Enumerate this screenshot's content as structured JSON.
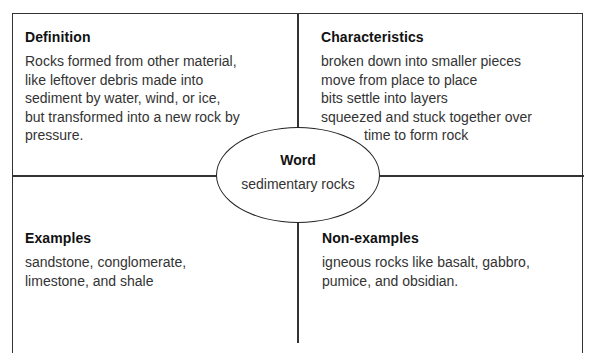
{
  "frayer_model": {
    "definition": {
      "heading": "Definition",
      "lines": [
        "Rocks formed from other material,",
        "like leftover debris made into",
        "sediment by water, wind, or ice,",
        "but transformed into a new rock by",
        "pressure."
      ]
    },
    "characteristics": {
      "heading": "Characteristics",
      "lines": [
        "broken down into smaller pieces",
        "move from place to place",
        "bits settle into layers",
        "squeezed and stuck together over",
        "time to form rock"
      ]
    },
    "examples": {
      "heading": "Examples",
      "lines": [
        "sandstone, conglomerate,",
        "limestone, and shale"
      ]
    },
    "non_examples": {
      "heading": "Non-examples",
      "lines": [
        "igneous rocks like basalt, gabbro,",
        "pumice, and obsidian."
      ]
    },
    "word": {
      "heading": "Word",
      "value": "sedimentary rocks"
    }
  }
}
